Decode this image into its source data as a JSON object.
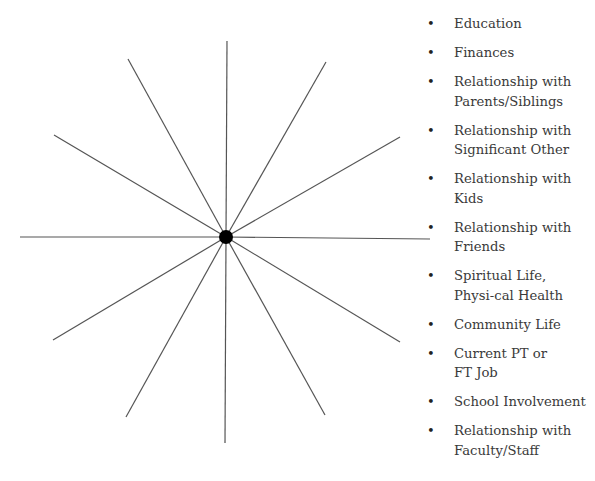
{
  "diagram": {
    "type": "wheel",
    "center": {
      "x": 226,
      "y": 237,
      "radius": 7
    },
    "spokes": [
      {
        "x": 227,
        "y": 41
      },
      {
        "x": 326,
        "y": 62
      },
      {
        "x": 400,
        "y": 137
      },
      {
        "x": 430,
        "y": 239
      },
      {
        "x": 400,
        "y": 342
      },
      {
        "x": 325,
        "y": 415
      },
      {
        "x": 225,
        "y": 443
      },
      {
        "x": 126,
        "y": 417
      },
      {
        "x": 53,
        "y": 340
      },
      {
        "x": 20,
        "y": 237
      },
      {
        "x": 54,
        "y": 135
      },
      {
        "x": 128,
        "y": 59
      }
    ]
  },
  "legend": {
    "bullet": "•",
    "items": [
      {
        "label": "Education"
      },
      {
        "label": "Finances"
      },
      {
        "label": "Relationship with Parents/Siblings"
      },
      {
        "label": "Relationship with Significant Other"
      },
      {
        "label": "Relationship with Kids"
      },
      {
        "label": "Relationship with Friends"
      },
      {
        "label": "Spiritual Life, Physi-cal Health"
      },
      {
        "label": "Community Life"
      },
      {
        "label": "Current PT or FT Job"
      },
      {
        "label": "School Involvement"
      },
      {
        "label": "Relationship with Faculty/Staff"
      }
    ]
  }
}
